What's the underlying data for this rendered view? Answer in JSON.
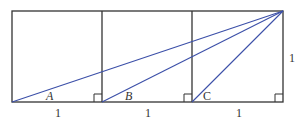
{
  "diagram": {
    "colors": {
      "frame": "#333333",
      "rays": "#3b4fa8"
    },
    "angle_labels": {
      "a": "A",
      "b": "B",
      "c": "C"
    },
    "side_labels": {
      "bottom_1": "1",
      "bottom_2": "1",
      "bottom_3": "1",
      "right": "1"
    },
    "squares": 3,
    "right_angle_markers": 3
  }
}
